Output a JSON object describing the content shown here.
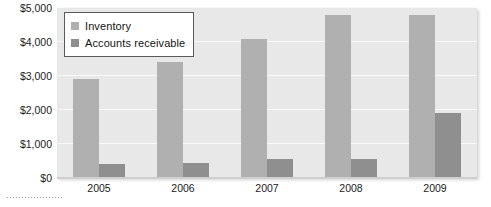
{
  "chart_data": {
    "type": "bar",
    "title": "",
    "subtitle": "",
    "xlabel": "",
    "ylabel": "",
    "categories": [
      "2005",
      "2006",
      "2007",
      "2008",
      "2009"
    ],
    "series": [
      {
        "name": "Inventory",
        "color": "#b0b0b0",
        "values": [
          2900,
          3400,
          4100,
          4800,
          4800
        ]
      },
      {
        "name": "Accounts receivable",
        "color": "#8f8f8f",
        "values": [
          400,
          450,
          550,
          560,
          1900
        ]
      }
    ],
    "ylim": [
      0,
      5000
    ],
    "yticks": [
      0,
      1000,
      2000,
      3000,
      4000,
      5000
    ],
    "ytick_labels": [
      "$0",
      "$1,000",
      "$2,000",
      "$3,000",
      "$4,000",
      "$5,000"
    ],
    "grid": true,
    "grid_axis": "y",
    "legend_position": "top-left",
    "plot_background": "#e8e8e8",
    "gridline_color": "#fafafa"
  },
  "legend": {
    "items": [
      {
        "label": "Inventory"
      },
      {
        "label": "Accounts receivable"
      }
    ]
  }
}
